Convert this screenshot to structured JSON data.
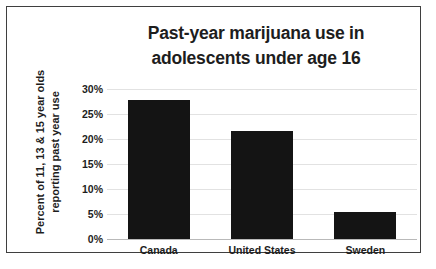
{
  "chart_data": {
    "type": "bar",
    "title": "Past-year marijuana use in adolescents under age 16",
    "title_lines": [
      "Past-year marijuana use in",
      "adolescents under age 16"
    ],
    "xlabel": "",
    "ylabel": "Percent of 11, 13 & 15 year olds reporting past year use",
    "ylabel_lines": [
      "Percent of 11, 13 & 15 year olds",
      "reporting past year use"
    ],
    "categories": [
      "Canada",
      "United States",
      "Sweden"
    ],
    "values": [
      27.8,
      21.6,
      5.4
    ],
    "value_labels": [
      "",
      "",
      ""
    ],
    "ylim": [
      0,
      30
    ],
    "ytick_values": [
      30,
      25,
      20,
      15,
      10,
      5,
      0
    ],
    "ytick_labels": [
      "30%",
      "25%",
      "20%",
      "15%",
      "10%",
      "5%",
      "0%"
    ],
    "grid": true,
    "legend": false,
    "legend_position": "none",
    "bar_color": "#141414",
    "gridline_color": "#e2e2e2",
    "text_color": "#1d1d1d",
    "background_color": "#ffffff",
    "border_color": "#3f3f3f"
  },
  "caption": {
    "text": ""
  }
}
